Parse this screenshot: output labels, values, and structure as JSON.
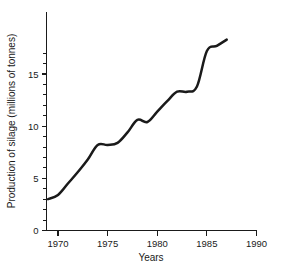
{
  "chart_data": {
    "type": "line",
    "title": "",
    "xlabel": "Years",
    "ylabel": "Production of silage (millions of tonnes)",
    "xlim": [
      1968.8,
      1990.8
    ],
    "ylim": [
      0,
      17.8
    ],
    "grid": false,
    "legend": false,
    "x_ticks_major": [
      1970,
      1975,
      1980,
      1985,
      1990
    ],
    "x_tick_labels": [
      "1970",
      "1975",
      "1980",
      "1985",
      "1990"
    ],
    "y_ticks_major": [
      0,
      5,
      10,
      15
    ],
    "y_tick_labels": [
      "0",
      "5",
      "10",
      "15"
    ],
    "y_ticks_minor": [
      1,
      2,
      3,
      4,
      6,
      7,
      8,
      9,
      11,
      12,
      13,
      14,
      16,
      17
    ],
    "series": [
      {
        "name": "Production of silage",
        "x": [
          1969.0,
          1970.0,
          1971.0,
          1972.0,
          1973.0,
          1974.0,
          1975.0,
          1976.0,
          1977.0,
          1978.0,
          1979.0,
          1980.0,
          1981.0,
          1982.0,
          1983.0,
          1984.0,
          1985.0,
          1986.0,
          1987.0
        ],
        "values": [
          3.0,
          3.4,
          4.5,
          5.6,
          6.8,
          8.2,
          8.2,
          8.4,
          9.4,
          10.6,
          10.4,
          11.4,
          12.4,
          13.3,
          13.3,
          13.8,
          17.2,
          17.7,
          18.3
        ]
      }
    ]
  },
  "axis_labels": {
    "x_title": "Years",
    "y_title": "Production of silage (millions of tonnes)"
  },
  "colors": {
    "line": "#1a1a1a",
    "axis": "#1a1a1a",
    "background": "#ffffff"
  }
}
